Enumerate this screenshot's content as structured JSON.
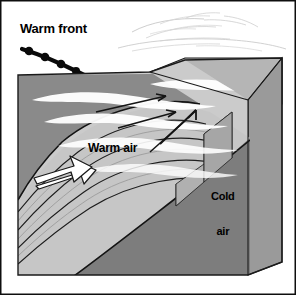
{
  "diagram": {
    "labels": {
      "warm_front": "Warm front",
      "warm_air": "Warm air",
      "cold_air_line1": "Cold",
      "cold_air_line2": "air"
    },
    "icons": {
      "warm_front_symbol": "warm-front-symbol-icon",
      "warm_air_arrow": "warm-air-flow-arrow-icon",
      "frontal_lift_arrow": "frontal-lift-arrow-icon",
      "cirrus_clouds": "cirrus-cloud-icon",
      "stratus_clouds": "stratus-cloud-icon"
    },
    "colors": {
      "background": "#ffffff",
      "border": "#000000",
      "sky": "#c9c9c9",
      "warm_air_slope": "#c2c2c2",
      "warm_air_slope_light": "#cfcfcf",
      "dark_wedge": "#8a8a8a",
      "cold_air": "#7d7d7d",
      "side_face": "#9a9a9a",
      "top_face": "#b5b5b5",
      "cloud": "#ffffff",
      "line": "#1a1a1a",
      "arrow_fill": "#ffffff",
      "text": "#000000"
    }
  }
}
